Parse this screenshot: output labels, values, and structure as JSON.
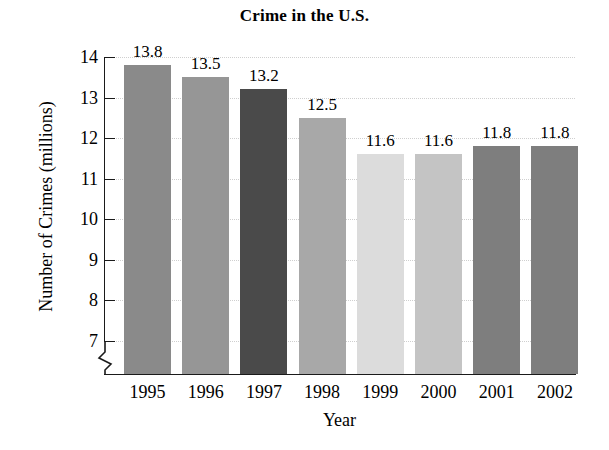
{
  "chart_data": {
    "type": "bar",
    "title": "Crime in the U.S.",
    "xlabel": "Year",
    "ylabel": "Number of Crimes (millions)",
    "categories": [
      "1995",
      "1996",
      "1997",
      "1998",
      "1999",
      "2000",
      "2001",
      "2002"
    ],
    "values": [
      13.8,
      13.5,
      13.2,
      12.5,
      11.6,
      11.6,
      11.8,
      11.8
    ],
    "value_labels": [
      "13.8",
      "13.5",
      "13.2",
      "12.5",
      "11.6",
      "11.6",
      "11.8",
      "11.8"
    ],
    "bar_colors": [
      "#8a8a8a",
      "#969696",
      "#4a4a4a",
      "#a8a8a8",
      "#dcdcdc",
      "#c4c4c4",
      "#7e7e7e",
      "#7e7e7e"
    ],
    "ylim": [
      6.4,
      14
    ],
    "yticks": [
      7,
      8,
      9,
      10,
      11,
      12,
      13,
      14
    ],
    "ytick_labels": [
      "7",
      "8",
      "9",
      "10",
      "11",
      "12",
      "13",
      "14"
    ],
    "grid": true,
    "grid_axis": "y",
    "axis_break": true,
    "legend": "none",
    "gridline_color": "#cfcfcf",
    "axis_color": "#1a1a1a"
  }
}
